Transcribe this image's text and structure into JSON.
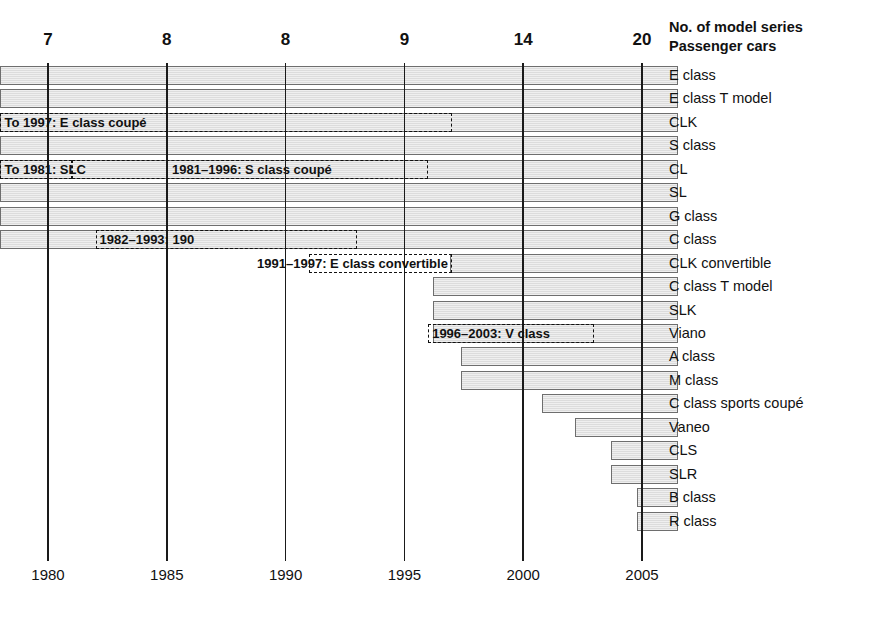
{
  "header": {
    "line1": "No. of model series",
    "line2": "Passenger cars"
  },
  "chart_data": {
    "type": "bar",
    "xlabel": "",
    "ylabel": "",
    "xlim": [
      1978.0,
      2006.5
    ],
    "grid": true,
    "legend": "none",
    "x_axis_ticks": [
      1980,
      1985,
      1990,
      1995,
      2000,
      2005
    ],
    "x_axis_tick_labels": [
      "1980",
      "1985",
      "1990",
      "1995",
      "2000",
      "2005"
    ],
    "top_counts": [
      {
        "at_year": 1980,
        "label": "7"
      },
      {
        "at_year": 1985,
        "label": "8"
      },
      {
        "at_year": 1990,
        "label": "8"
      },
      {
        "at_year": 1995,
        "label": "9"
      },
      {
        "at_year": 2000,
        "label": "14"
      },
      {
        "at_year": 2005,
        "label": "20"
      }
    ],
    "categories": [
      "E class",
      "E class T model",
      "CLK",
      "S class",
      "CL",
      "SL",
      "G class",
      "C class",
      "CLK convertible",
      "C class T model",
      "SLK",
      "Viano",
      "A class",
      "M class",
      "C class sports coupé",
      "Vaneo",
      "CLS",
      "SLR",
      "B class",
      "R class"
    ],
    "bars": [
      {
        "label": "E class",
        "start": 1978.0,
        "end": 2006.5
      },
      {
        "label": "E class T model",
        "start": 1978.0,
        "end": 2006.5
      },
      {
        "label": "CLK",
        "start": 1978.0,
        "end": 2006.5
      },
      {
        "label": "S class",
        "start": 1978.0,
        "end": 2006.5
      },
      {
        "label": "CL",
        "start": 1978.0,
        "end": 2006.5
      },
      {
        "label": "SL",
        "start": 1978.0,
        "end": 2006.5
      },
      {
        "label": "G class",
        "start": 1978.0,
        "end": 2006.5
      },
      {
        "label": "C class",
        "start": 1978.0,
        "end": 2006.5
      },
      {
        "label": "CLK convertible",
        "start": 1996.9,
        "end": 2006.5
      },
      {
        "label": "C class T model",
        "start": 1996.2,
        "end": 2006.5
      },
      {
        "label": "SLK",
        "start": 1996.2,
        "end": 2006.5
      },
      {
        "label": "Viano",
        "start": 1996.2,
        "end": 2006.5
      },
      {
        "label": "A class",
        "start": 1997.4,
        "end": 2006.5
      },
      {
        "label": "M class",
        "start": 1997.4,
        "end": 2006.5
      },
      {
        "label": "C class sports coupé",
        "start": 2000.8,
        "end": 2006.5
      },
      {
        "label": "Vaneo",
        "start": 2002.2,
        "end": 2006.5
      },
      {
        "label": "CLS",
        "start": 2003.7,
        "end": 2006.5
      },
      {
        "label": "SLR",
        "start": 2003.7,
        "end": 2006.5
      },
      {
        "label": "B class",
        "start": 2004.8,
        "end": 2006.5
      },
      {
        "label": "R class",
        "start": 2004.8,
        "end": 2006.5
      }
    ],
    "annotations": [
      {
        "text": "To 1997: E class coupé",
        "start": 1978.0,
        "end": 1997.0,
        "row": 2,
        "align": "left"
      },
      {
        "text": "To 1981: SLC",
        "start": 1978.0,
        "end": 1981.0,
        "row": 4,
        "align": "left"
      },
      {
        "text": "1981–1996: S class coupé",
        "start": 1981.0,
        "end": 1996.0,
        "row": 4,
        "align": "center"
      },
      {
        "text": "1982–1993: 190",
        "start": 1982.0,
        "end": 1993.0,
        "row": 7,
        "align": "left"
      },
      {
        "text": "1991–1997: E class convertible",
        "start": 1991.0,
        "end": 1997.0,
        "row": 8,
        "align": "right-out"
      },
      {
        "text": "1996–2003: V class",
        "start": 1996.0,
        "end": 2003.0,
        "row": 11,
        "align": "left"
      }
    ]
  },
  "colors": {
    "bar_fill": "#dcdcdc",
    "bar_stroke": "#6e6e6e",
    "axis": "#1a1a1a",
    "text": "#111111",
    "background": "#ffffff"
  }
}
